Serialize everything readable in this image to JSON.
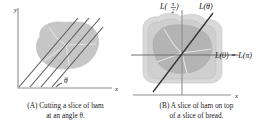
{
  "figure": {
    "panels": [
      {
        "id": "A",
        "axis_x_label": "x",
        "axis_y_label": "y",
        "angle_label": "θ",
        "caption_line1": "(A) Cutting a slice of ham",
        "caption_line2": "at an angle θ.",
        "shape_names": [
          "ham-blob"
        ]
      },
      {
        "id": "B",
        "axis_x_label": "x",
        "axis_y_label": "y",
        "label_vertical_prefix": "L",
        "label_vertical_open": "(",
        "label_vertical_num": "π",
        "label_vertical_den": "2",
        "label_vertical_close": ")",
        "label_theta": "L(θ)",
        "label_horizontal": "L(0) = L(π)",
        "caption_line1": "(B) A slice of ham on top",
        "caption_line2": "of a slice of bread.",
        "shape_names": [
          "bread-slice",
          "ham-blob"
        ]
      }
    ],
    "colors": {
      "ham_fill": "#c6c6c6",
      "ham_dark_fill": "#b4b4b4",
      "bread_outer": "#d9d9d9",
      "bread_inner": "#cfcfcf",
      "axis": "#8e8e8e",
      "cut_line": "#333333",
      "text": "#1a1a1a"
    }
  }
}
